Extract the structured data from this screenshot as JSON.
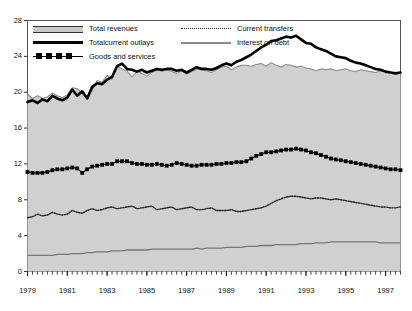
{
  "chart_data": {
    "type": "area",
    "title": "",
    "subtitle": "",
    "xlabel": "",
    "ylabel": "",
    "xlim": [
      1979,
      1997.75
    ],
    "ylim": [
      0,
      28
    ],
    "yticks": [
      0,
      4,
      8,
      12,
      16,
      20,
      24,
      28
    ],
    "xticks": [
      1979,
      1981,
      1983,
      1985,
      1987,
      1989,
      1991,
      1993,
      1995,
      1997
    ],
    "xtick_labels": [
      "1979",
      "1981",
      "1983",
      "1985",
      "1987",
      "1989",
      "1991",
      "1993",
      "1995",
      "1997"
    ],
    "ytick_labels": [
      "0",
      "4",
      "8",
      "12",
      "16",
      "20",
      "24",
      "28"
    ],
    "grid": false,
    "minor_xticks_per_year": 4,
    "legend_position": "top-left-inside",
    "frequency": "quarterly",
    "x": [
      1979.0,
      1979.25,
      1979.5,
      1979.75,
      1980.0,
      1980.25,
      1980.5,
      1980.75,
      1981.0,
      1981.25,
      1981.5,
      1981.75,
      1982.0,
      1982.25,
      1982.5,
      1982.75,
      1983.0,
      1983.25,
      1983.5,
      1983.75,
      1984.0,
      1984.25,
      1984.5,
      1984.75,
      1985.0,
      1985.25,
      1985.5,
      1985.75,
      1986.0,
      1986.25,
      1986.5,
      1986.75,
      1987.0,
      1987.25,
      1987.5,
      1987.75,
      1988.0,
      1988.25,
      1988.5,
      1988.75,
      1989.0,
      1989.25,
      1989.5,
      1989.75,
      1990.0,
      1990.25,
      1990.5,
      1990.75,
      1991.0,
      1991.25,
      1991.5,
      1991.75,
      1992.0,
      1992.25,
      1992.5,
      1992.75,
      1993.0,
      1993.25,
      1993.5,
      1993.75,
      1994.0,
      1994.25,
      1994.5,
      1994.75,
      1995.0,
      1995.25,
      1995.5,
      1995.75,
      1996.0,
      1996.25,
      1996.5,
      1996.75,
      1997.0,
      1997.25,
      1997.5,
      1997.75
    ],
    "series": [
      {
        "name": "Total revenues",
        "style": "shaded-area-thin-gray-outline",
        "color": "#8b8b8b",
        "fill": "#d0d0d0",
        "values": [
          19.8,
          19.3,
          19.6,
          19.3,
          19.5,
          19.9,
          19.6,
          19.4,
          19.7,
          20.5,
          20.4,
          19.9,
          19.5,
          20.2,
          21.3,
          21.1,
          21.9,
          21.4,
          22.9,
          22.6,
          22.4,
          21.7,
          22.3,
          22.1,
          21.8,
          22.2,
          22.5,
          22.3,
          22.5,
          22.3,
          22.1,
          22.4,
          22.0,
          22.3,
          22.6,
          22.5,
          22.4,
          22.2,
          22.5,
          22.8,
          22.9,
          22.5,
          22.8,
          23.0,
          23.0,
          22.9,
          23.1,
          23.2,
          22.9,
          23.3,
          23.0,
          22.8,
          23.1,
          23.0,
          22.8,
          22.9,
          22.7,
          22.6,
          22.4,
          22.6,
          22.5,
          22.6,
          22.4,
          22.5,
          22.6,
          22.4,
          22.3,
          22.5,
          22.4,
          22.3,
          22.2,
          22.4,
          22.3,
          22.2,
          22.1,
          22.2
        ]
      },
      {
        "name": "Totalcurrent outlays",
        "style": "thick-black-line",
        "color": "#000000",
        "values": [
          18.9,
          19.1,
          18.8,
          19.2,
          19.0,
          19.6,
          19.3,
          19.1,
          19.4,
          20.3,
          19.6,
          20.1,
          19.3,
          20.6,
          21.0,
          20.9,
          21.4,
          21.7,
          22.9,
          23.2,
          22.6,
          22.5,
          22.3,
          22.5,
          22.2,
          22.4,
          22.6,
          22.5,
          22.6,
          22.6,
          22.4,
          22.5,
          22.2,
          22.5,
          22.8,
          22.6,
          22.6,
          22.5,
          22.7,
          23.0,
          23.2,
          23.0,
          23.4,
          23.6,
          23.9,
          24.2,
          24.6,
          25.0,
          25.3,
          25.7,
          25.8,
          26.0,
          26.2,
          26.1,
          26.3,
          25.9,
          25.5,
          25.4,
          25.0,
          24.8,
          24.6,
          24.3,
          24.0,
          23.9,
          23.8,
          23.5,
          23.3,
          23.2,
          23.0,
          22.8,
          22.6,
          22.5,
          22.3,
          22.2,
          22.1,
          22.2
        ]
      },
      {
        "name": "Goods and services",
        "style": "black-square-markers",
        "color": "#000000",
        "values": [
          11.1,
          11.0,
          11.0,
          11.0,
          11.1,
          11.3,
          11.4,
          11.4,
          11.5,
          11.6,
          11.5,
          11.0,
          11.4,
          11.7,
          11.8,
          11.9,
          12.0,
          12.0,
          12.3,
          12.3,
          12.3,
          12.1,
          12.0,
          12.0,
          11.9,
          11.9,
          12.0,
          11.9,
          11.8,
          11.9,
          12.1,
          12.0,
          11.9,
          11.8,
          11.8,
          11.9,
          11.9,
          11.9,
          12.0,
          12.0,
          12.1,
          12.1,
          12.2,
          12.2,
          12.3,
          12.6,
          12.9,
          13.1,
          13.3,
          13.3,
          13.4,
          13.5,
          13.6,
          13.6,
          13.7,
          13.6,
          13.5,
          13.3,
          13.2,
          13.0,
          12.8,
          12.6,
          12.5,
          12.4,
          12.3,
          12.2,
          12.1,
          12.0,
          11.9,
          11.8,
          11.7,
          11.6,
          11.5,
          11.4,
          11.4,
          11.3
        ]
      },
      {
        "name": "Current transfers",
        "style": "dotted-line",
        "color": "#222222",
        "values": [
          6.0,
          6.1,
          6.4,
          6.2,
          6.3,
          6.6,
          6.4,
          6.3,
          6.4,
          6.8,
          6.6,
          6.5,
          6.8,
          7.0,
          6.8,
          6.9,
          7.1,
          7.2,
          7.0,
          7.1,
          7.2,
          7.3,
          7.0,
          7.1,
          7.2,
          7.3,
          6.9,
          7.0,
          7.1,
          7.2,
          6.9,
          7.0,
          7.1,
          7.2,
          6.9,
          6.9,
          7.0,
          7.1,
          6.8,
          6.8,
          6.8,
          6.9,
          6.7,
          6.7,
          6.8,
          6.9,
          7.0,
          7.1,
          7.3,
          7.6,
          7.9,
          8.1,
          8.3,
          8.4,
          8.4,
          8.3,
          8.2,
          8.1,
          8.2,
          8.2,
          8.1,
          8.0,
          8.1,
          8.0,
          7.9,
          7.8,
          7.7,
          7.6,
          7.5,
          7.4,
          7.3,
          7.2,
          7.2,
          7.1,
          7.1,
          7.2
        ]
      },
      {
        "name": "Interest on debt",
        "style": "thin-gray-line",
        "color": "#777777",
        "values": [
          1.8,
          1.8,
          1.8,
          1.8,
          1.8,
          1.8,
          1.9,
          1.9,
          1.9,
          2.0,
          2.0,
          2.0,
          2.1,
          2.1,
          2.2,
          2.2,
          2.2,
          2.3,
          2.3,
          2.3,
          2.4,
          2.4,
          2.4,
          2.4,
          2.4,
          2.5,
          2.5,
          2.5,
          2.5,
          2.5,
          2.5,
          2.5,
          2.5,
          2.5,
          2.6,
          2.5,
          2.6,
          2.6,
          2.6,
          2.6,
          2.7,
          2.7,
          2.7,
          2.7,
          2.8,
          2.8,
          2.8,
          2.9,
          2.9,
          2.9,
          3.0,
          3.0,
          3.0,
          3.0,
          3.0,
          3.1,
          3.1,
          3.1,
          3.2,
          3.2,
          3.2,
          3.3,
          3.3,
          3.3,
          3.3,
          3.3,
          3.3,
          3.3,
          3.3,
          3.3,
          3.3,
          3.2,
          3.2,
          3.2,
          3.2,
          3.2
        ]
      }
    ]
  },
  "legend": {
    "items": [
      {
        "label": "Total revenues",
        "key": "area"
      },
      {
        "label": "Totalcurrent outlays",
        "key": "thick"
      },
      {
        "label": "Goods and services",
        "key": "squares"
      },
      {
        "label": "Current transfers",
        "key": "dotted"
      },
      {
        "label": "Interest on debt",
        "key": "gray"
      }
    ]
  }
}
